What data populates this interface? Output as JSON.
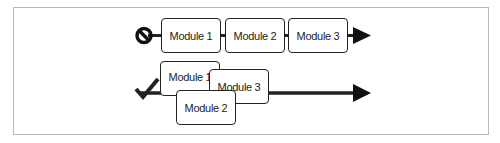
{
  "diagram": {
    "rows": [
      {
        "status": "incorrect",
        "status_icon": "prohibited-icon",
        "modules": [
          {
            "label": "Module 1"
          },
          {
            "label": "Module 2"
          },
          {
            "label": "Module 3"
          }
        ]
      },
      {
        "status": "correct",
        "status_icon": "checkmark-icon",
        "modules": [
          {
            "label": "Module 1"
          },
          {
            "label": "Module 3"
          },
          {
            "label": "Module 2"
          }
        ]
      }
    ],
    "colors": {
      "stroke": "#222222",
      "frame": "#b8b8b8",
      "background": "#ffffff"
    }
  }
}
